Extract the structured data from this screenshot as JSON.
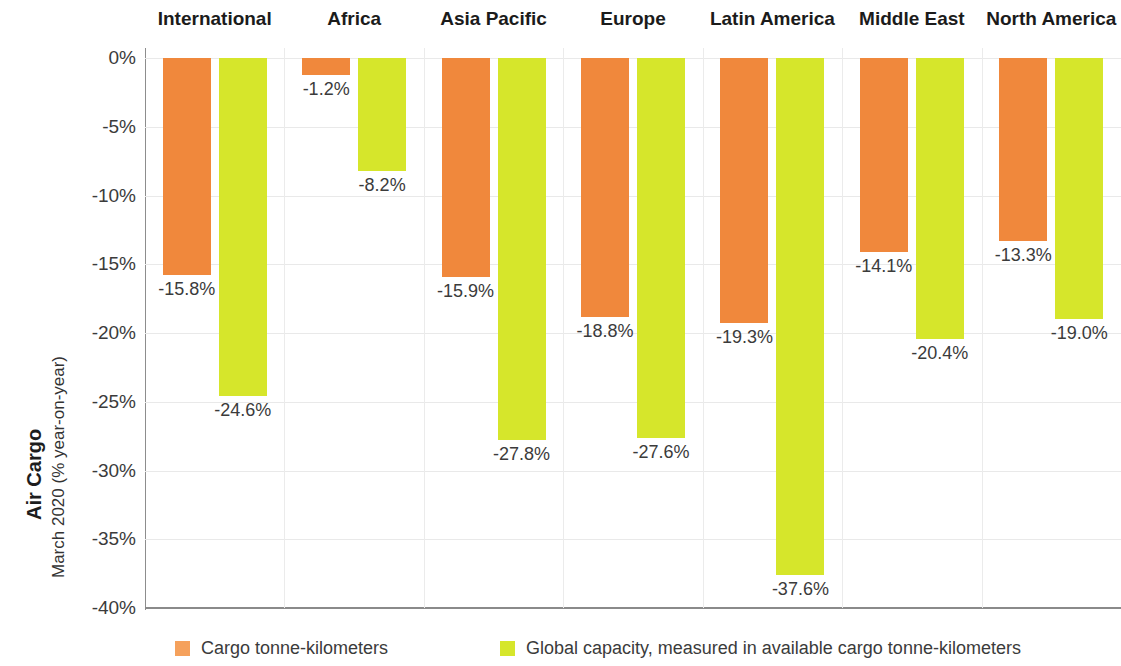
{
  "chart_data": {
    "type": "bar",
    "title": "Air Cargo",
    "subtitle": "March 2020 (% year-on-year)",
    "xlabel": "",
    "ylabel": "Air Cargo March 2020 (% year-on-year)",
    "ylim": [
      -40,
      0
    ],
    "grid": true,
    "legend_position": "bottom",
    "ytick_labels": [
      "0%",
      "-5%",
      "-10%",
      "-15%",
      "-20%",
      "-25%",
      "-30%",
      "-35%",
      "-40%"
    ],
    "ytick_values": [
      0,
      -5,
      -10,
      -15,
      -20,
      -25,
      -30,
      -35,
      -40
    ],
    "categories": [
      "International",
      "Africa",
      "Asia Pacific",
      "Europe",
      "Latin America",
      "Middle East",
      "North America"
    ],
    "series": [
      {
        "name": "Cargo tonne-kilometers",
        "color": "#F0883C",
        "values": [
          -15.8,
          -1.2,
          -15.9,
          -18.8,
          -19.3,
          -14.1,
          -13.3
        ],
        "labels": [
          "-15.8%",
          "-1.2%",
          "-15.9%",
          "-18.8%",
          "-19.3%",
          "-14.1%",
          "-13.3%"
        ]
      },
      {
        "name": "Global capacity, measured in available cargo tonne-kilometers",
        "color": "#D6E62B",
        "values": [
          -24.6,
          -8.2,
          -27.8,
          -27.6,
          -37.6,
          -20.4,
          -19.0
        ],
        "labels": [
          "-24.6%",
          "-8.2%",
          "-27.8%",
          "-27.6%",
          "-37.6%",
          "-20.4%",
          "-19.0%"
        ]
      }
    ]
  },
  "axis": {
    "title_main": "Air Cargo",
    "title_sub": "March 2020 (% year-on-year)"
  },
  "legend": {
    "items": [
      {
        "label": "Cargo tonne-kilometers",
        "color": "#F5A15C"
      },
      {
        "label": "Global capacity, measured in available cargo tonne-kilometers",
        "color": "#D6E62B"
      }
    ]
  }
}
